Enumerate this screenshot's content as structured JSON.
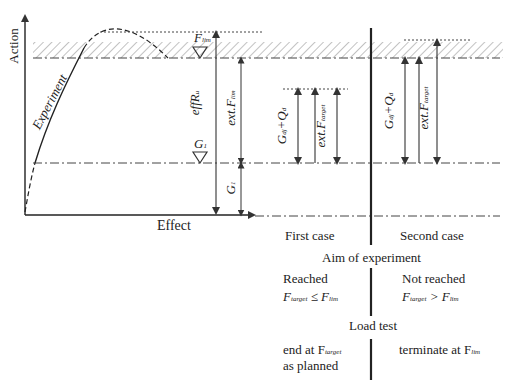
{
  "axes": {
    "y_label": "Action",
    "x_label": "Effect"
  },
  "curve": {
    "label": "Experiment"
  },
  "levels": {
    "f_lim": {
      "symbol": "F",
      "sub": "lim"
    },
    "g1": {
      "symbol": "G",
      "sub": "1"
    }
  },
  "dimensions": {
    "eff_r": {
      "symbol": "effR",
      "sub": "u"
    },
    "ext_f_lim": {
      "symbol": "ext.F",
      "sub": "lim"
    },
    "g1_dim": {
      "symbol": "G",
      "sub": "1"
    },
    "first_gq": {
      "symbol": "G",
      "sub1": "dj",
      "plus": "+Q",
      "sub2": "d"
    },
    "first_ext_target": {
      "symbol": "ext.F",
      "sub": "target"
    },
    "second_gq": {
      "symbol": "G",
      "sub1": "dj",
      "plus": "+Q",
      "sub2": "d"
    },
    "second_ext_target": {
      "symbol": "ext.F",
      "sub": "target"
    }
  },
  "cases": {
    "first": "First case",
    "second": "Second case"
  },
  "sections": {
    "aim": "Aim of experiment",
    "load_test": "Load test"
  },
  "aim": {
    "first_status": "Reached",
    "first_cond": {
      "lhs": "F",
      "lhs_sub": "target",
      "op": " ≤ F",
      "rhs_sub": "lim"
    },
    "second_status": "Not reached",
    "second_cond": {
      "lhs": "F",
      "lhs_sub": "target",
      "op": " > F",
      "rhs_sub": "lim"
    }
  },
  "load_test": {
    "first_line1": "end at F",
    "first_line1_sub": "target",
    "first_line2": "as planned",
    "second": "terminate at F",
    "second_sub": "lim"
  }
}
